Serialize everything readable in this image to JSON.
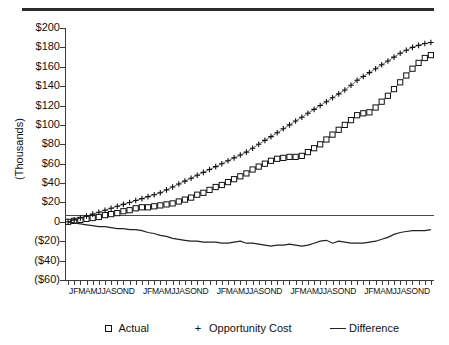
{
  "axes": {
    "ylabel": "(Thousands)",
    "yticks": [
      "$200",
      "$180",
      "$160",
      "$140",
      "$120",
      "$100",
      "$80",
      "$60",
      "$40",
      "$20",
      "0",
      "($20)",
      "($40)",
      "($60)"
    ],
    "yvalues": [
      200,
      180,
      160,
      140,
      120,
      100,
      80,
      60,
      40,
      20,
      0,
      -20,
      -40,
      -60
    ],
    "xyear_label": "JFMAMJJASOND",
    "xyear_labels": [
      "JFMAMJJASOND",
      "JFMAMJJASOND",
      "JFMAMJJASOND",
      "JFMAMJJASOND",
      "JFMAMJJASOND"
    ]
  },
  "legend": {
    "items": [
      {
        "label": "Actual",
        "marker": "square-marker"
      },
      {
        "label": "Opportunity Cost",
        "marker": "plus-marker"
      },
      {
        "label": "Difference",
        "marker": "line-marker"
      }
    ]
  },
  "chart_data": {
    "type": "line",
    "title": "",
    "xlabel": "",
    "ylabel": "(Thousands)",
    "ylim": [
      -60,
      200
    ],
    "grid": false,
    "legend_position": "bottom",
    "units": "thousands of dollars",
    "x_tick_labels": [
      "J",
      "F",
      "M",
      "A",
      "M",
      "J",
      "J",
      "A",
      "S",
      "O",
      "N",
      "D"
    ],
    "x_periods": 60,
    "x_year_groups": 5,
    "series": [
      {
        "name": "Actual",
        "marker": "square",
        "values": [
          0,
          1,
          2,
          3,
          4,
          5,
          7,
          8,
          9,
          11,
          12,
          14,
          15,
          15,
          16,
          17,
          18,
          19,
          21,
          23,
          25,
          28,
          30,
          33,
          36,
          38,
          41,
          44,
          47,
          50,
          54,
          57,
          60,
          63,
          65,
          66,
          67,
          67,
          68,
          72,
          76,
          80,
          85,
          90,
          95,
          100,
          105,
          110,
          112,
          113,
          118,
          124,
          130,
          137,
          144,
          151,
          158,
          164,
          169,
          172
        ]
      },
      {
        "name": "Opportunity Cost",
        "marker": "plus",
        "values": [
          0,
          2,
          4,
          6,
          8,
          10,
          12,
          14,
          16,
          18,
          20,
          22,
          24,
          26,
          28,
          30,
          33,
          36,
          39,
          42,
          45,
          48,
          51,
          54,
          57,
          60,
          63,
          66,
          69,
          72,
          76,
          80,
          84,
          88,
          92,
          96,
          100,
          104,
          108,
          112,
          116,
          120,
          124,
          128,
          132,
          136,
          141,
          146,
          150,
          154,
          158,
          162,
          166,
          170,
          174,
          177,
          180,
          182,
          184,
          185
        ]
      },
      {
        "name": "Difference",
        "marker": "none",
        "values": [
          0,
          -1,
          -2,
          -3,
          -4,
          -5,
          -5,
          -6,
          -7,
          -7,
          -8,
          -8,
          -9,
          -11,
          -12,
          -14,
          -15,
          -17,
          -18,
          -19,
          -20,
          -20,
          -21,
          -21,
          -21,
          -22,
          -22,
          -21,
          -20,
          -22,
          -22,
          -23,
          -24,
          -25,
          -24,
          -24,
          -23,
          -24,
          -25,
          -24,
          -22,
          -20,
          -19,
          -22,
          -20,
          -21,
          -22,
          -22,
          -22,
          -21,
          -20,
          -18,
          -16,
          -13,
          -11,
          -10,
          -9,
          -9,
          -9,
          -8
        ]
      }
    ]
  }
}
